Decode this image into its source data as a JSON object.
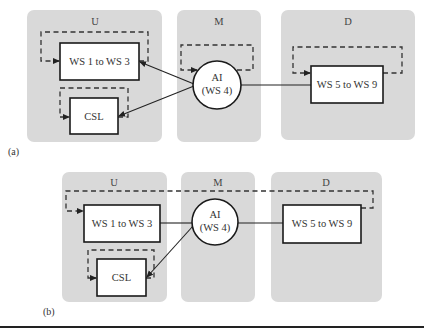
{
  "figure_a": {
    "caption": "(a)",
    "panels": [
      {
        "id": "U",
        "label": "U"
      },
      {
        "id": "M",
        "label": "M"
      },
      {
        "id": "D",
        "label": "D"
      }
    ],
    "nodes": {
      "ws1_3": "WS 1 to WS 3",
      "csl": "CSL",
      "ai_line1": "AI",
      "ai_line2": "(WS 4)",
      "ws5_9": "WS 5 to WS 9"
    }
  },
  "figure_b": {
    "caption": "(b)",
    "panels": [
      {
        "id": "U",
        "label": "U"
      },
      {
        "id": "M",
        "label": "M"
      },
      {
        "id": "D",
        "label": "D"
      }
    ],
    "nodes": {
      "ws1_3": "WS 1 to WS 3",
      "csl": "CSL",
      "ai_line1": "AI",
      "ai_line2": "(WS 4)",
      "ws5_9": "WS 5 to WS 9"
    }
  },
  "colors": {
    "panel_fill": "#d9d9d9",
    "stroke": "#1a1a1a",
    "node_fill": "#ffffff"
  }
}
